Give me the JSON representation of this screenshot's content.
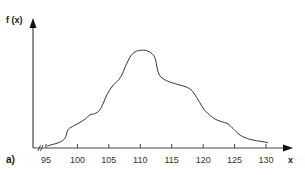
{
  "chart_data": {
    "type": "line",
    "title": "",
    "panel_label": "a)",
    "xlabel": "x",
    "ylabel": "f (x)",
    "xlim": [
      93,
      132
    ],
    "x_ticks": [
      95,
      100,
      105,
      110,
      115,
      120,
      125,
      130
    ],
    "x_tick_labels": [
      "95",
      "100",
      "105",
      "110",
      "115",
      "120",
      "125",
      "130"
    ],
    "y_ticks": [],
    "axis_break": "x-axis break near origin (//)",
    "grid": false,
    "legend": null,
    "series": [
      {
        "name": "f(x)",
        "color": "#333333",
        "x": [
          95.2,
          97,
          98,
          98.5,
          99.2,
          101,
          102,
          102.7,
          103.5,
          104.2,
          104.7,
          105.6,
          106.6,
          107.2,
          107.7,
          108.6,
          109.7,
          111,
          111.9,
          112.4,
          112.9,
          113.8,
          115.6,
          117.3,
          118.3,
          119.2,
          120.3,
          121.9,
          123.8,
          124.6,
          125.9,
          127.5,
          129.4,
          130.3
        ],
        "values": [
          0.02,
          0.05,
          0.09,
          0.17,
          0.2,
          0.26,
          0.31,
          0.32,
          0.35,
          0.43,
          0.5,
          0.58,
          0.64,
          0.7,
          0.77,
          0.87,
          0.91,
          0.91,
          0.88,
          0.83,
          0.7,
          0.64,
          0.6,
          0.57,
          0.53,
          0.45,
          0.35,
          0.27,
          0.23,
          0.19,
          0.12,
          0.08,
          0.06,
          0.05
        ]
      }
    ]
  }
}
